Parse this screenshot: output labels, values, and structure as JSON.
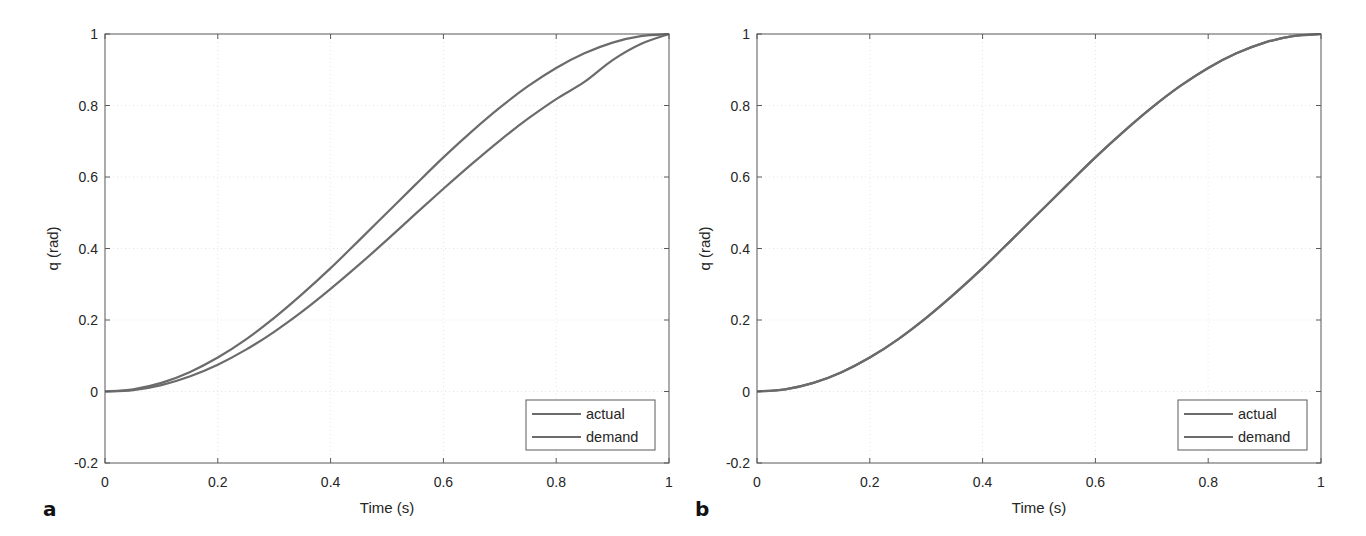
{
  "chart_data": [
    {
      "type": "line",
      "panel_label": "a",
      "title": "",
      "xlabel": "Time (s)",
      "ylabel": "q (rad)",
      "xlim": [
        0,
        1
      ],
      "ylim": [
        -0.2,
        1
      ],
      "xticks": [
        "0",
        "0.2",
        "0.4",
        "0.6",
        "0.8",
        "1"
      ],
      "yticks": [
        "-0.2",
        "0",
        "0.2",
        "0.4",
        "0.6",
        "0.8",
        "1"
      ],
      "grid": true,
      "legend_position": "lower right",
      "x": [
        0,
        0.05,
        0.1,
        0.15,
        0.2,
        0.25,
        0.3,
        0.35,
        0.4,
        0.45,
        0.5,
        0.55,
        0.6,
        0.65,
        0.7,
        0.75,
        0.8,
        0.85,
        0.9,
        0.95,
        1.0
      ],
      "series": [
        {
          "name": "actual",
          "color": "#6b6b6b",
          "values": [
            0,
            0.004,
            0.018,
            0.042,
            0.075,
            0.117,
            0.167,
            0.224,
            0.287,
            0.354,
            0.424,
            0.496,
            0.567,
            0.636,
            0.702,
            0.763,
            0.818,
            0.866,
            0.927,
            0.972,
            1.0
          ]
        },
        {
          "name": "demand",
          "color": "#6b6b6b",
          "values": [
            0,
            0.006,
            0.024,
            0.054,
            0.095,
            0.146,
            0.206,
            0.273,
            0.345,
            0.422,
            0.5,
            0.578,
            0.655,
            0.727,
            0.794,
            0.854,
            0.905,
            0.946,
            0.976,
            0.994,
            1.0
          ]
        }
      ]
    },
    {
      "type": "line",
      "panel_label": "b",
      "title": "",
      "xlabel": "Time (s)",
      "ylabel": "q (rad)",
      "xlim": [
        0,
        1
      ],
      "ylim": [
        -0.2,
        1
      ],
      "xticks": [
        "0",
        "0.2",
        "0.4",
        "0.6",
        "0.8",
        "1"
      ],
      "yticks": [
        "-0.2",
        "0",
        "0.2",
        "0.4",
        "0.6",
        "0.8",
        "1"
      ],
      "grid": true,
      "legend_position": "lower right",
      "x": [
        0,
        0.05,
        0.1,
        0.15,
        0.2,
        0.25,
        0.3,
        0.35,
        0.4,
        0.45,
        0.5,
        0.55,
        0.6,
        0.65,
        0.7,
        0.75,
        0.8,
        0.85,
        0.9,
        0.95,
        1.0
      ],
      "series": [
        {
          "name": "actual",
          "color": "#6b6b6b",
          "values": [
            0,
            0.006,
            0.024,
            0.054,
            0.095,
            0.146,
            0.206,
            0.273,
            0.345,
            0.422,
            0.5,
            0.578,
            0.655,
            0.727,
            0.794,
            0.854,
            0.905,
            0.946,
            0.976,
            0.994,
            1.0
          ]
        },
        {
          "name": "demand",
          "color": "#6b6b6b",
          "values": [
            0,
            0.006,
            0.024,
            0.054,
            0.095,
            0.146,
            0.206,
            0.273,
            0.345,
            0.422,
            0.5,
            0.578,
            0.655,
            0.727,
            0.794,
            0.854,
            0.905,
            0.946,
            0.976,
            0.994,
            1.0
          ]
        }
      ]
    }
  ],
  "panels": [
    {
      "label": "a",
      "xlabel": "Time (s)",
      "ylabel": "q (rad)",
      "legend": [
        "actual",
        "demand"
      ]
    },
    {
      "label": "b",
      "xlabel": "Time (s)",
      "ylabel": "q (rad)",
      "legend": [
        "actual",
        "demand"
      ]
    }
  ]
}
